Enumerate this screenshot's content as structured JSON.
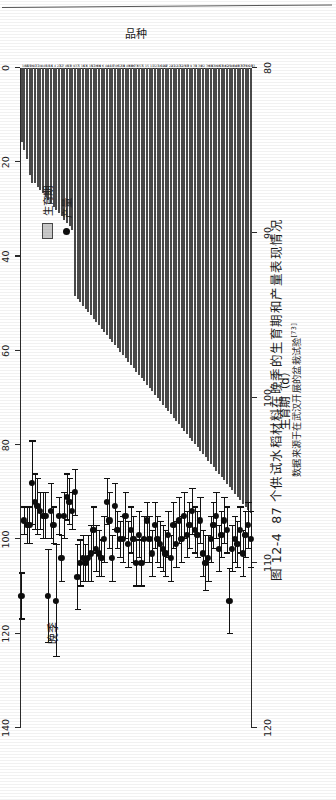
{
  "figure": {
    "number": "图 12-4",
    "title": "87 个供试水稻材料在晚季的生育期和产量表现情况",
    "source_note": "数据来源于在武汉开展的盆栽试验",
    "source_ref": "[73]"
  },
  "legend": {
    "items": [
      {
        "label": "生育期",
        "marker": "gray-bar",
        "color": "#c9c9c9"
      },
      {
        "label": "产量",
        "marker": "black-dot",
        "color": "#0d0d0d"
      }
    ]
  },
  "annotation": {
    "season": "晚季"
  },
  "chart_data": {
    "type": "bar",
    "title": "87 个供试水稻材料在晚季的生育期和产量表现情况",
    "xlabel": "品种",
    "grid": false,
    "legend_position": "top-right",
    "axes": {
      "yield": {
        "label": "产量（g/盆）",
        "unit": "g/盆",
        "position": "top",
        "range": [
          0,
          140
        ],
        "ticks": [
          0,
          20,
          40,
          60,
          80,
          100,
          120,
          140
        ]
      },
      "duration": {
        "label": "生育期（d）",
        "unit": "d",
        "position": "bottom",
        "range": [
          80,
          120
        ],
        "ticks": [
          80,
          90,
          100,
          110,
          120
        ]
      }
    },
    "categories": [
      "104",
      "51",
      "55",
      "86",
      "47",
      "17",
      "20",
      "4",
      "48",
      "18",
      "11",
      "6",
      "4",
      "23",
      "32",
      "7",
      "40",
      "53",
      "8",
      "9",
      "37",
      "5",
      "16",
      "13",
      "6",
      "19",
      "57",
      "26",
      "66",
      "9",
      "6",
      "44",
      "44",
      "18",
      "7",
      "46",
      "52",
      "59",
      "8",
      "48",
      "60",
      "86",
      "73",
      "6",
      "53",
      "5",
      "1",
      "5",
      "11",
      "3",
      "23",
      "16",
      "102",
      "29",
      "7",
      "22",
      "43",
      "22",
      "13",
      "32",
      "25",
      "68",
      "3",
      "9",
      "33",
      "9",
      "39",
      "8",
      "2",
      "36",
      "68",
      "97",
      "46",
      "46",
      "53",
      "84",
      "62",
      "25",
      "90",
      "84",
      "48",
      "87",
      "87",
      "35",
      "66",
      "28",
      "33"
    ],
    "series": [
      {
        "name": "生育期",
        "unit": "d",
        "render": "bar",
        "axis": "duration",
        "values": [
          84.5,
          85.0,
          85.5,
          86.5,
          87.0,
          87.0,
          87.2,
          87.4,
          87.6,
          87.8,
          88.0,
          88.2,
          88.4,
          88.6,
          88.8,
          89.0,
          89.2,
          89.4,
          89.6,
          89.8,
          93.8,
          94.0,
          94.2,
          94.4,
          94.6,
          94.8,
          95.0,
          95.2,
          95.4,
          95.6,
          95.8,
          96.0,
          96.2,
          96.4,
          96.6,
          96.8,
          97.0,
          97.2,
          97.4,
          97.6,
          97.8,
          98.0,
          98.2,
          98.4,
          98.6,
          98.8,
          99.0,
          99.2,
          99.4,
          99.6,
          99.8,
          100.0,
          100.2,
          100.4,
          100.6,
          100.8,
          101.0,
          101.2,
          101.4,
          101.6,
          101.8,
          102.0,
          102.2,
          102.4,
          102.6,
          102.8,
          103.0,
          103.2,
          103.4,
          103.6,
          103.8,
          104.0,
          104.2,
          104.4,
          104.6,
          104.8,
          105.0,
          105.2,
          105.4,
          105.6,
          105.8,
          106.0,
          106.2,
          106.4,
          106.6,
          106.8,
          107.0
        ]
      },
      {
        "name": "产量",
        "unit": "g/盆",
        "render": "point-with-errorbar",
        "axis": "yield",
        "values": [
          112,
          96,
          97,
          97,
          88,
          92,
          93,
          94,
          95,
          95,
          112,
          94,
          97,
          113,
          95,
          104,
          95,
          91,
          92,
          94,
          90,
          108,
          105,
          104,
          105,
          104,
          103,
          98,
          102,
          103,
          104,
          100,
          92,
          96,
          104,
          93,
          98,
          100,
          100,
          95,
          101,
          98,
          100,
          105,
          99,
          105,
          100,
          96,
          100,
          103,
          97,
          100,
          101,
          102,
          103,
          99,
          104,
          97,
          101,
          96,
          100,
          95,
          99,
          97,
          94,
          98,
          99,
          96,
          103,
          105,
          104,
          100,
          97,
          95,
          102,
          99,
          96,
          98,
          113,
          102,
          100,
          101,
          98,
          103,
          99,
          97,
          100
        ],
        "errors": [
          5,
          3,
          4,
          4,
          9,
          6,
          6,
          4,
          5,
          5,
          10,
          6,
          4,
          12,
          4,
          5,
          5,
          5,
          5,
          4,
          5,
          7,
          5,
          5,
          4,
          5,
          6,
          5,
          5,
          5,
          4,
          5,
          5,
          6,
          5,
          5,
          4,
          4,
          5,
          5,
          5,
          5,
          5,
          5,
          5,
          5,
          5,
          4,
          5,
          5,
          5,
          5,
          5,
          5,
          5,
          5,
          5,
          5,
          5,
          5,
          5,
          5,
          5,
          5,
          5,
          5,
          5,
          5,
          5,
          6,
          5,
          5,
          5,
          5,
          5,
          5,
          5,
          5,
          7,
          5,
          5,
          5,
          5,
          5,
          5,
          5,
          6
        ]
      }
    ]
  }
}
